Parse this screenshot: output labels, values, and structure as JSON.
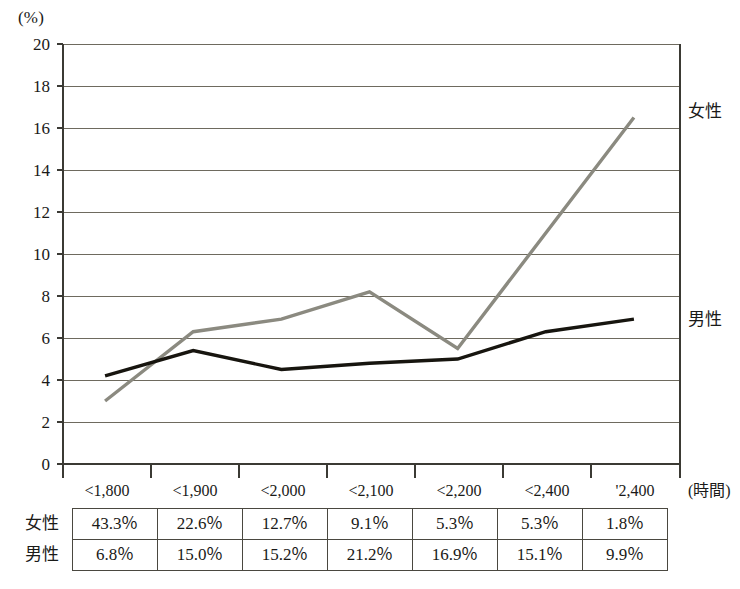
{
  "chart_data": {
    "type": "line",
    "title": "",
    "xlabel": "(時間)",
    "ylabel": "(%)",
    "ylim": [
      0,
      20
    ],
    "ytick_step": 2,
    "grid": true,
    "legend_position": "right-inline",
    "categories": [
      "<1,800",
      "<1,900",
      "<2,000",
      "<2,100",
      "<2,200",
      "<2,400",
      "'2,400"
    ],
    "yticks": [
      "20",
      "18",
      "16",
      "14",
      "12",
      "10",
      "8",
      "6",
      "4",
      "2",
      "0"
    ],
    "series": [
      {
        "name": "女性",
        "color": "#8b8a80",
        "values": [
          3.0,
          6.3,
          6.9,
          8.2,
          5.5,
          11.0,
          16.5
        ]
      },
      {
        "name": "男性",
        "color": "#17150f",
        "values": [
          4.2,
          5.4,
          4.5,
          4.8,
          5.0,
          6.3,
          6.9
        ]
      }
    ]
  },
  "table": {
    "rows": [
      {
        "header": "女性",
        "cells": [
          "43.3％",
          "22.6％",
          "12.7％",
          "9.1％",
          "5.3％",
          "5.3％",
          "1.8％"
        ]
      },
      {
        "header": "男性",
        "cells": [
          "6.8％",
          "15.0％",
          "15.2％",
          "21.2％",
          "16.9％",
          "15.1％",
          "9.9％"
        ]
      }
    ]
  }
}
